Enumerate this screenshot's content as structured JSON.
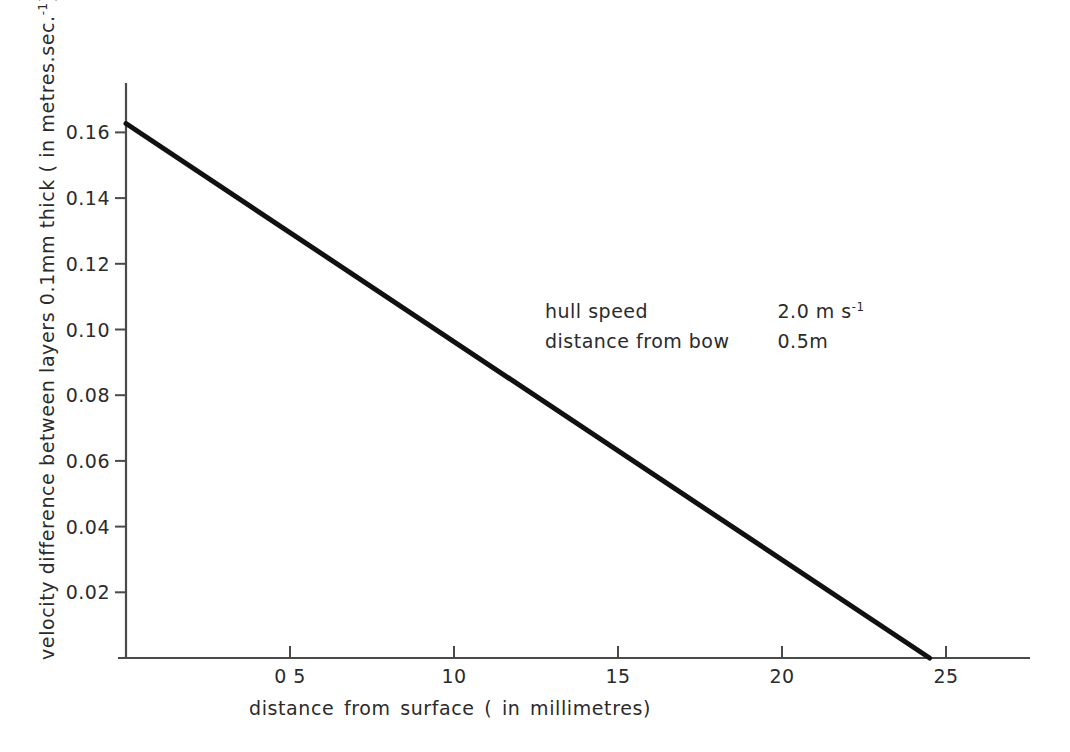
{
  "chart_data": {
    "type": "line",
    "title": "",
    "xlabel": "distance  from  surface  ( in  millimetres)",
    "ylabel": "velocity difference between layers 0.1mm thick ( in  metres.sec.",
    "ylabel_sup": "-1",
    "ylabel_tail": ")",
    "xlim": [
      0,
      2.65
    ],
    "ylim": [
      0,
      0.1755
    ],
    "grid": false,
    "legend": "none",
    "xticks": [
      0.5,
      1.0,
      1.5,
      2.0,
      2.5
    ],
    "xticklabels": [
      "0 5",
      "10",
      "15",
      "20",
      "25"
    ],
    "yticks": [
      0.02,
      0.04,
      0.06,
      0.08,
      0.1,
      0.12,
      0.14,
      0.16
    ],
    "yticklabels": [
      "0.02",
      "0.04",
      "0.06",
      "0.08",
      "0.10",
      "0.12",
      "0.14",
      "0.16"
    ],
    "series": [
      {
        "name": "velocity difference",
        "x": [
          0.0,
          2.45
        ],
        "y": [
          0.1627,
          0.0
        ],
        "color": "#111111",
        "linewidth": 5
      }
    ],
    "annotations": [
      {
        "label": "hull speed",
        "value": "2.0 m s",
        "value_sup": "-1"
      },
      {
        "label": "distance from bow",
        "value": "0.5m",
        "value_sup": ""
      }
    ]
  },
  "axis_color": "#4a4a4a",
  "text_color": "#2b2b2b"
}
